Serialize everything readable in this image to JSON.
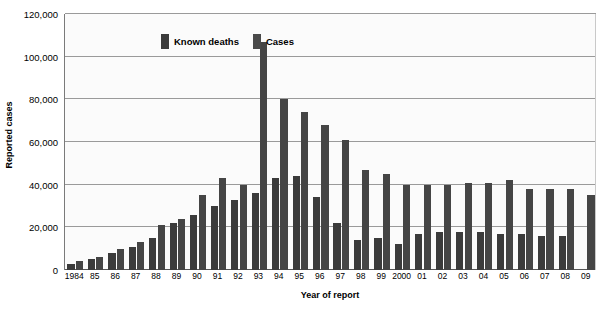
{
  "chart_data": {
    "type": "bar",
    "title": "",
    "xlabel": "Year of report",
    "ylabel": "Reported cases",
    "ylim": [
      0,
      120000
    ],
    "ytick_values": [
      0,
      20000,
      40000,
      60000,
      80000,
      100000,
      120000
    ],
    "ytick_labels": [
      "0",
      "20,000",
      "40,000",
      "60,000",
      "80,000",
      "100,000",
      "120,000"
    ],
    "grid": true,
    "legend_position": "top-left-inside",
    "categories": [
      "1984",
      "85",
      "86",
      "87",
      "88",
      "89",
      "90",
      "91",
      "92",
      "93",
      "94",
      "95",
      "96",
      "97",
      "98",
      "99",
      "2000",
      "01",
      "02",
      "03",
      "04",
      "05",
      "06",
      "07",
      "08",
      "09"
    ],
    "series": [
      {
        "name": "Known deaths",
        "color": "#3b3b3b",
        "values": [
          3000,
          5000,
          8000,
          11000,
          15000,
          22000,
          26000,
          30000,
          33000,
          36000,
          43000,
          44000,
          34000,
          22000,
          14000,
          15000,
          12000,
          17000,
          18000,
          18000,
          18000,
          17000,
          17000,
          16000,
          16000,
          null
        ]
      },
      {
        "name": "Cases",
        "color": "#454545",
        "values": [
          4000,
          6000,
          10000,
          13000,
          21000,
          24000,
          35000,
          43000,
          40000,
          107000,
          80000,
          74000,
          68000,
          61000,
          47000,
          45000,
          40000,
          40000,
          40000,
          41000,
          41000,
          42000,
          38000,
          38000,
          38000,
          35000
        ]
      }
    ],
    "legend": [
      {
        "label": "Known deaths",
        "swatch": "deaths-swatch"
      },
      {
        "label": "Cases",
        "swatch": "cases-swatch"
      }
    ]
  },
  "colors": {
    "bar_deaths": "#3b3b3b",
    "bar_cases": "#454545",
    "gridline": "#9a9a9a",
    "axis": "#7a7a7a",
    "plot_background": "#fbfbfb",
    "page_background": "#ffffff",
    "text": "#000000"
  }
}
